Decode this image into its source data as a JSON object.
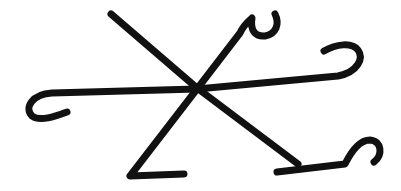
{
  "image": {
    "description": "Hand-drawn black sigil-like symbol on white background",
    "background_color": "#ffffff",
    "ink_color": "#111111",
    "stroke_width": 7
  }
}
